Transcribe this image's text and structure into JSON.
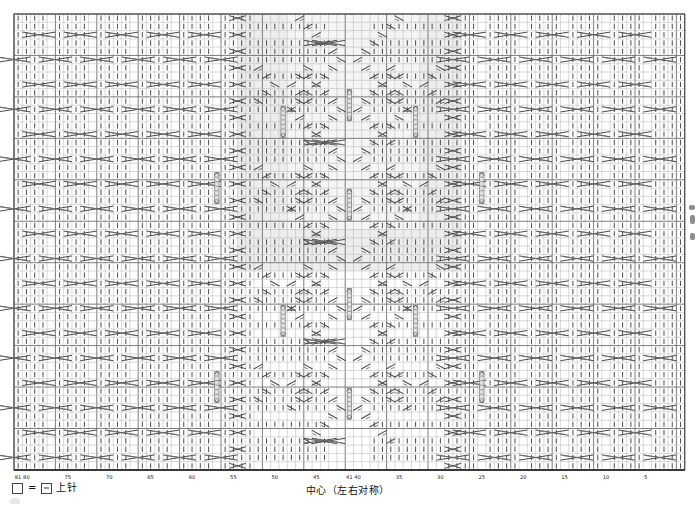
{
  "chart_data": {
    "type": "heatmap",
    "title": "",
    "grid": {
      "columns": 81,
      "rows": 55,
      "cell_w": 8.28,
      "cell_h": 8.29,
      "origin_x": 14,
      "origin_y": 14
    },
    "xlabel": "",
    "ylabel": "",
    "column_numbering": {
      "direction": "right-to-left",
      "first": 1,
      "last": 81,
      "tick_interval": 5,
      "labels": [
        81,
        80,
        75,
        70,
        65,
        60,
        55,
        50,
        45,
        41,
        40,
        35,
        30,
        25,
        20,
        15,
        10,
        5
      ],
      "label_columns": [
        81,
        80,
        75,
        70,
        65,
        60,
        55,
        50,
        45,
        41,
        40,
        35,
        30,
        25,
        20,
        15,
        10,
        5
      ]
    },
    "center_column": 41,
    "symmetry": "left-right mirror about column 41",
    "colors": {
      "grid_line": "#b9b9b9",
      "grid_line_major": "#6f6f6f",
      "symbol": "#4a4a4a",
      "shade_fill": "#ededed",
      "frame": "#4f4f4f",
      "background": "#ffffff"
    },
    "shaded_region": {
      "col_start": 28,
      "col_end": 54,
      "row_start": 25,
      "row_end": 55
    },
    "purl_columns_note": "columns drawn with vertical dash = knit/上针 ground",
    "symbol_counts": {
      "cable_4st": 112,
      "twist_2st": 96,
      "bobble_cluster": 12
    }
  },
  "legend": {
    "blank_swatch_name": "empty-square",
    "equals": "=",
    "dash_swatch_name": "dash-square",
    "text": "上针",
    "center_text": "中心（左右对称）"
  },
  "axis": {
    "tick_labels": [
      "81",
      "80",
      "75",
      "70",
      "65",
      "60",
      "55",
      "50",
      "45",
      "41",
      "40",
      "35",
      "30",
      "25",
      "20",
      "15",
      "10",
      "5"
    ]
  }
}
